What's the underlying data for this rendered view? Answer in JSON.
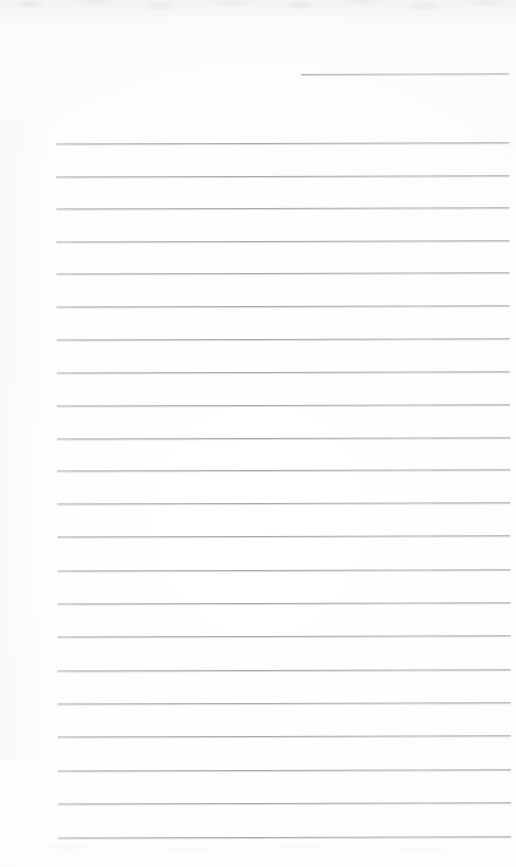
{
  "document": {
    "kind": "scanned-ruled-page",
    "title": "Blank Lined Page",
    "written_text": "",
    "page_width": 516,
    "page_height": 867,
    "background_color": "#fdfdfd",
    "rule_color": "#a9a9ae",
    "partial_rule_color": "#b4b4b9"
  },
  "ruling": {
    "left_margin_x": 57,
    "right_margin_x": 510,
    "line_spacing": 32.4,
    "full_rule_count": 22,
    "partial_rule_count": 1,
    "partial_rule": {
      "label": "header-rule",
      "x_start": 302,
      "x_end": 510,
      "y": 74
    },
    "full_rules": [
      {
        "y": 143
      },
      {
        "y": 176
      },
      {
        "y": 208
      },
      {
        "y": 241
      },
      {
        "y": 273
      },
      {
        "y": 306
      },
      {
        "y": 339
      },
      {
        "y": 372
      },
      {
        "y": 405
      },
      {
        "y": 438
      },
      {
        "y": 470
      },
      {
        "y": 503
      },
      {
        "y": 536
      },
      {
        "y": 570
      },
      {
        "y": 603
      },
      {
        "y": 636
      },
      {
        "y": 670
      },
      {
        "y": 703
      },
      {
        "y": 736
      },
      {
        "y": 770
      },
      {
        "y": 803
      },
      {
        "y": 837
      }
    ]
  },
  "artifacts": {
    "top_edge_noise": "faint grey mottled scan band",
    "bottom_edge_noise": "faint grey smudge band",
    "skew_degrees": -0.16
  }
}
